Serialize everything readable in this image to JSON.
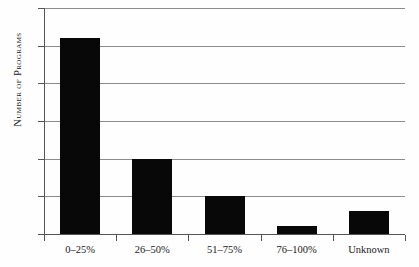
{
  "chart_data": {
    "type": "bar",
    "title": "",
    "subtitle": "",
    "xlabel": "",
    "ylabel": "Number of Programs",
    "categories": [
      "0–25%",
      "26–50%",
      "51–75%",
      "76–100%",
      "Unknown"
    ],
    "values": [
      26,
      10,
      5,
      1,
      3
    ],
    "series": [
      {
        "name": "Number of Programs",
        "values": [
          26,
          10,
          5,
          1,
          3
        ]
      }
    ],
    "ylim": [
      0,
      30
    ],
    "ytick_values": [
      0,
      5,
      10,
      15,
      20,
      25,
      30
    ],
    "ytick_labels": [
      "0",
      "5",
      "10",
      "15",
      "20",
      "25",
      "30"
    ],
    "grid": true,
    "grid_axis": "y",
    "legend": false,
    "legend_position": "none",
    "bar_color": "#080808",
    "gridline_color": "#8c8c8c",
    "axis_color": "#555555",
    "background_color": "#fefefe"
  },
  "axes": {
    "y_title": "Number of Programs"
  }
}
